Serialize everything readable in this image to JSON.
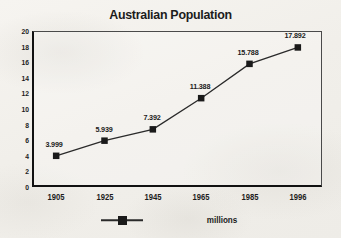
{
  "chart_data": {
    "type": "line",
    "title": "Australian Population",
    "xlabel": "",
    "ylabel": "",
    "categories": [
      "1905",
      "1925",
      "1945",
      "1965",
      "1985",
      "1996"
    ],
    "values": [
      3.999,
      5.939,
      7.392,
      11.388,
      15.788,
      17.892
    ],
    "point_labels": [
      "3.999",
      "5.939",
      "7.392",
      "11.388",
      "15.788",
      "17.892"
    ],
    "series": [
      {
        "name": "millions",
        "values": [
          3.999,
          5.939,
          7.392,
          11.388,
          15.788,
          17.892
        ]
      }
    ],
    "ylim": [
      0,
      20
    ],
    "ytick_step": 2,
    "ytick_labels": [
      "0",
      "2",
      "4",
      "6",
      "8",
      "10",
      "12",
      "14",
      "16",
      "18",
      "20"
    ],
    "xtick_labels": [
      "1905",
      "1925",
      "1945",
      "1965",
      "1985",
      "1996"
    ],
    "grid": false,
    "legend": {
      "position": "bottom",
      "entries": [
        {
          "label": "millions",
          "marker": "square",
          "color": "#1a1a1a"
        }
      ]
    },
    "marker": "square",
    "line_color": "#2a2a2a",
    "marker_color": "#1a1a1a",
    "background_color": "#f4f2ee"
  },
  "legend": {
    "label": "millions"
  }
}
